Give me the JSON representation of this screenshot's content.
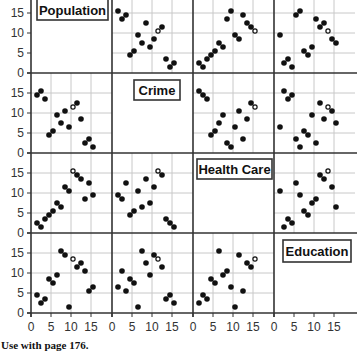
{
  "chart_data": {
    "type": "scatter",
    "subtype": "scatterplot-matrix",
    "title": "",
    "variables": [
      "Population",
      "Crime",
      "Health Care",
      "Education"
    ],
    "axis_range": [
      0,
      20
    ],
    "ticks": [
      0,
      5,
      10,
      15
    ],
    "grid": true,
    "grid_step": 5,
    "highlighted_index": 9,
    "highlight_style": "open circle",
    "points": [
      {
        "Population": 1,
        "Crime": 14,
        "Health Care": 2,
        "Education": 4
      },
      {
        "Population": 2,
        "Crime": 15,
        "Health Care": 1,
        "Education": 2
      },
      {
        "Population": 3,
        "Crime": 13,
        "Health Care": 3,
        "Education": 3
      },
      {
        "Population": 4,
        "Crime": 4,
        "Health Care": 4,
        "Education": 8
      },
      {
        "Population": 5,
        "Crime": 5,
        "Health Care": 5,
        "Education": 7
      },
      {
        "Population": 6,
        "Crime": 9,
        "Health Care": 7,
        "Education": 9
      },
      {
        "Population": 7,
        "Crime": 7,
        "Health Care": 6,
        "Education": 15
      },
      {
        "Population": 8,
        "Crime": 10,
        "Health Care": 11,
        "Education": 14
      },
      {
        "Population": 9,
        "Crime": 6,
        "Health Care": 10,
        "Education": 1
      },
      {
        "Population": 10,
        "Crime": 11,
        "Health Care": 15,
        "Education": 13
      },
      {
        "Population": 11,
        "Crime": 12,
        "Health Care": 14,
        "Education": 11
      },
      {
        "Population": 12,
        "Crime": 8,
        "Health Care": 13,
        "Education": 12
      },
      {
        "Population": 13,
        "Crime": 2,
        "Health Care": 8,
        "Education": 10
      },
      {
        "Population": 14,
        "Crime": 3,
        "Health Care": 12,
        "Education": 5
      },
      {
        "Population": 15,
        "Crime": 1,
        "Health Care": 9,
        "Education": 6
      }
    ],
    "xlabel": "",
    "ylabel": "",
    "legend": null
  },
  "footer": {
    "text": "Use with page 176."
  },
  "colors": {
    "point": "#111111",
    "frame": "#333333",
    "grid": "#c8c8c8",
    "label_box_border": "#333333"
  }
}
